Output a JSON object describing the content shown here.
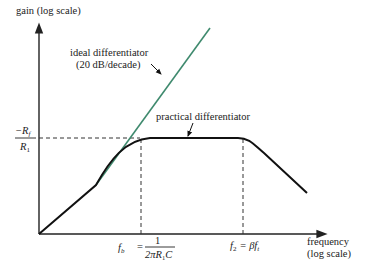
{
  "diagram": {
    "type": "bode-magnitude-plot",
    "y_axis_label": "gain (log scale)",
    "x_axis_label_line1": "frequency",
    "x_axis_label_line2": "(log scale)",
    "gain_label_numerator": "−R",
    "gain_label_numerator_sub": "f",
    "gain_label_denominator": "R",
    "gain_label_denominator_sub": "1",
    "ideal_label_line1": "ideal differentiator",
    "ideal_label_line2": "(20 dB/decade)",
    "practical_label": "practical differentiator",
    "fb_label": "f",
    "fb_sub": "b",
    "fb_eq": "=",
    "fb_num": "1",
    "fb_den": "2πR",
    "fb_den_sub": "1",
    "fb_den_tail": "C",
    "f2_label": "f",
    "f2_sub": "2",
    "f2_eq": "= βf",
    "f2_tail_sub": "t",
    "colors": {
      "ideal_line": "#3f8a6e",
      "practical_curve": "#111111",
      "axes": "#222222",
      "dashed": "#333333"
    }
  }
}
